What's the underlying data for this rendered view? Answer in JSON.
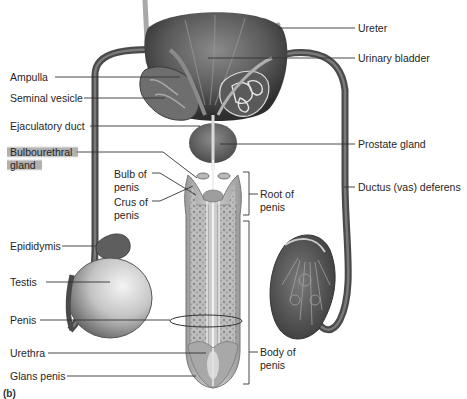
{
  "figure": {
    "panel_label": "(b)"
  },
  "labels_left": [
    {
      "id": "ampulla",
      "text": "Ampulla"
    },
    {
      "id": "seminal-vesicle",
      "text": "Seminal vesicle"
    },
    {
      "id": "ejaculatory-duct",
      "text": "Ejaculatory duct"
    },
    {
      "id": "bulbourethral-gland",
      "line1": "Bulbourethral",
      "line2": "gland",
      "highlighted": true
    },
    {
      "id": "bulb-of-penis",
      "line1": "Bulb of",
      "line2": "penis"
    },
    {
      "id": "crus-of-penis",
      "line1": "Crus of",
      "line2": "penis"
    },
    {
      "id": "epididymis",
      "text": "Epididymis"
    },
    {
      "id": "testis",
      "text": "Testis"
    },
    {
      "id": "penis",
      "text": "Penis"
    },
    {
      "id": "urethra",
      "text": "Urethra"
    },
    {
      "id": "glans-penis",
      "text": "Glans penis"
    }
  ],
  "labels_right": [
    {
      "id": "ureter",
      "text": "Ureter"
    },
    {
      "id": "urinary-bladder",
      "text": "Urinary bladder"
    },
    {
      "id": "prostate-gland",
      "text": "Prostate gland"
    },
    {
      "id": "ductus-deferens",
      "text": "Ductus (vas) deferens"
    },
    {
      "id": "root-of-penis",
      "line1": "Root of",
      "line2": "penis"
    },
    {
      "id": "body-of-penis",
      "line1": "Body of",
      "line2": "penis"
    }
  ],
  "colors": {
    "tissue_dark": "#4a4a4a",
    "tissue_mid": "#7a7a7a",
    "tissue_light": "#c8c8c8",
    "leader_line": "#333333",
    "highlight": "#9a9a9a"
  }
}
